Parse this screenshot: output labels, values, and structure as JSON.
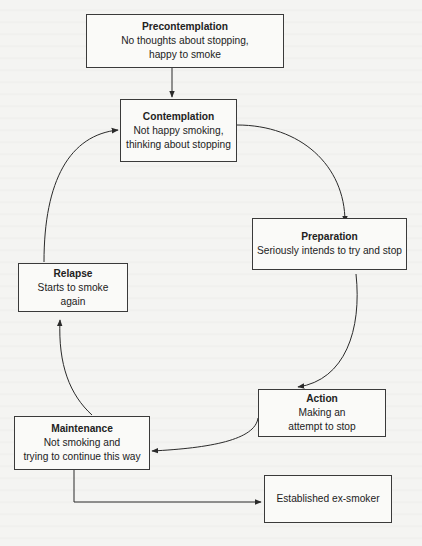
{
  "diagram": {
    "type": "stages-of-change cycle",
    "nodes": [
      {
        "id": "precontemplation",
        "title": "Precontemplation",
        "desc": "No thoughts about stopping,\nhappy to smoke"
      },
      {
        "id": "contemplation",
        "title": "Contemplation",
        "desc": "Not happy smoking,\nthinking about stopping"
      },
      {
        "id": "preparation",
        "title": "Preparation",
        "desc": "Seriously intends to try and stop"
      },
      {
        "id": "action",
        "title": "Action",
        "desc": "Making an\nattempt to stop"
      },
      {
        "id": "maintenance",
        "title": "Maintenance",
        "desc": "Not smoking and\ntrying to continue this way"
      },
      {
        "id": "relapse",
        "title": "Relapse",
        "desc": "Starts to smoke\nagain"
      },
      {
        "id": "established",
        "title": "",
        "desc": "Established ex-smoker"
      }
    ],
    "edges": [
      {
        "from": "precontemplation",
        "to": "contemplation"
      },
      {
        "from": "contemplation",
        "to": "preparation"
      },
      {
        "from": "preparation",
        "to": "action"
      },
      {
        "from": "action",
        "to": "maintenance"
      },
      {
        "from": "maintenance",
        "to": "relapse"
      },
      {
        "from": "relapse",
        "to": "contemplation"
      },
      {
        "from": "maintenance",
        "to": "established"
      }
    ],
    "colors": {
      "line": "#2a2a2a",
      "box_border": "#3a3a3a",
      "background": "#f4f4f2"
    }
  }
}
